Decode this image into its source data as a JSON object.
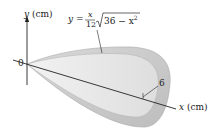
{
  "figure": {
    "y_axis_label_var": "y",
    "y_axis_label_unit": "(cm)",
    "x_axis_label_var": "x",
    "x_axis_label_unit": "(cm)",
    "origin_label": "0",
    "dimension_label": "6",
    "formula": {
      "lhs": "y =",
      "numerator": "x",
      "denominator": "12",
      "radicand": "36 − x",
      "exponent": "2"
    },
    "colors": {
      "outer_surface": "#c8c8c8",
      "inner_surface": "#e6e6e6",
      "rim": "#b4b4b4",
      "axis": "#222222"
    }
  }
}
